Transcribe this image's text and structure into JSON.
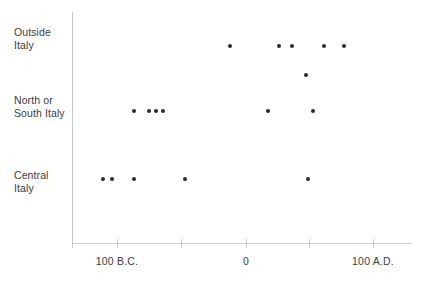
{
  "chart_data": {
    "type": "scatter",
    "title": "",
    "subtitle": "",
    "xlabel": "",
    "ylabel": "",
    "grid": false,
    "legend": null,
    "legend_position": "none",
    "x_axis": {
      "label": "",
      "range_years": [
        -135,
        115
      ],
      "tick_positions_years": [
        -135,
        -100,
        -50,
        0,
        50,
        100
      ],
      "tick_labels": [
        "",
        "100 B.C.",
        "",
        "0",
        "",
        "100 A.D."
      ],
      "labeled_ticks": [
        {
          "value": -100,
          "label": "100 B.C."
        },
        {
          "value": 0,
          "label": "0"
        },
        {
          "value": 100,
          "label": "100 A.D."
        }
      ]
    },
    "y_axis": {
      "label": "",
      "type": "categorical",
      "categories": [
        "Outside\nItaly",
        "North or\nSouth Italy",
        "Central\nItaly"
      ],
      "category_plain": [
        "Outside Italy",
        "North or South Italy",
        "Central Italy"
      ]
    },
    "series": [
      {
        "name": "Outside Italy",
        "category": "Outside Italy",
        "values": [
          -12,
          26,
          36,
          61,
          77
        ]
      },
      {
        "name": "Outside Italy (lower sub-row)",
        "category": "Outside Italy",
        "values": [
          47
        ]
      },
      {
        "name": "North or South Italy",
        "category": "North or South Italy",
        "values": [
          -87,
          -76,
          -70,
          -65,
          17,
          52
        ]
      },
      {
        "name": "Central Italy",
        "category": "Central Italy",
        "values": [
          -111,
          -105,
          -87,
          -47,
          48
        ]
      }
    ],
    "point_count": 17,
    "marker": {
      "shape": "circle",
      "color": "#2b2b33",
      "size_px": 4
    },
    "colors": {
      "background": "#ffffff",
      "axis": "#c9c9cd",
      "text": "#3c3c42",
      "marker": "#2b2b33"
    }
  },
  "axis_geometry": {
    "y_axis_x_px": 72,
    "y_axis_top_px": 12,
    "y_axis_bottom_px": 248,
    "x_axis_y_px": 243,
    "x_axis_left_px": 72,
    "x_axis_right_px": 412,
    "tick_x_px": [
      72,
      117,
      181,
      246,
      309,
      373
    ],
    "tick_label_y_px": 255,
    "row_y_px": {
      "outside_italy": 46,
      "outside_italy_sub": 75,
      "north_or_south_italy": 111,
      "central_italy": 179
    },
    "category_label_x_px": 14,
    "category_label_y_px": {
      "outside_italy": 26,
      "north_or_south_italy": 94,
      "central_italy": 169
    }
  },
  "points": [
    {
      "name": "outside-italy-1",
      "cx": 230,
      "cy": 46,
      "year": -12,
      "category": "Outside Italy"
    },
    {
      "name": "outside-italy-2",
      "cx": 279,
      "cy": 46,
      "year": 26,
      "category": "Outside Italy"
    },
    {
      "name": "outside-italy-3",
      "cx": 292,
      "cy": 46,
      "year": 36,
      "category": "Outside Italy"
    },
    {
      "name": "outside-italy-4",
      "cx": 324,
      "cy": 46,
      "year": 61,
      "category": "Outside Italy"
    },
    {
      "name": "outside-italy-5",
      "cx": 344,
      "cy": 46,
      "year": 77,
      "category": "Outside Italy"
    },
    {
      "name": "outside-italy-6",
      "cx": 306,
      "cy": 75,
      "year": 47,
      "category": "Outside Italy"
    },
    {
      "name": "north-south-italy-1",
      "cx": 134,
      "cy": 111,
      "year": -87,
      "category": "North or South Italy"
    },
    {
      "name": "north-south-italy-2",
      "cx": 149,
      "cy": 111,
      "year": -76,
      "category": "North or South Italy"
    },
    {
      "name": "north-south-italy-3",
      "cx": 156,
      "cy": 111,
      "year": -70,
      "category": "North or South Italy"
    },
    {
      "name": "north-south-italy-4",
      "cx": 163,
      "cy": 111,
      "year": -65,
      "category": "North or South Italy"
    },
    {
      "name": "north-south-italy-5",
      "cx": 268,
      "cy": 111,
      "year": 17,
      "category": "North or South Italy"
    },
    {
      "name": "north-south-italy-6",
      "cx": 313,
      "cy": 111,
      "year": 52,
      "category": "North or South Italy"
    },
    {
      "name": "central-italy-1",
      "cx": 103,
      "cy": 179,
      "year": -111,
      "category": "Central Italy"
    },
    {
      "name": "central-italy-2",
      "cx": 112,
      "cy": 179,
      "year": -105,
      "category": "Central Italy"
    },
    {
      "name": "central-italy-3",
      "cx": 134,
      "cy": 179,
      "year": -87,
      "category": "Central Italy"
    },
    {
      "name": "central-italy-4",
      "cx": 185,
      "cy": 179,
      "year": -47,
      "category": "Central Italy"
    },
    {
      "name": "central-italy-5",
      "cx": 308,
      "cy": 179,
      "year": 48,
      "category": "Central Italy"
    }
  ],
  "ticks": [
    {
      "name": "tick-0",
      "x": 72,
      "label": ""
    },
    {
      "name": "tick-1",
      "x": 117,
      "label": "100 B.C."
    },
    {
      "name": "tick-2",
      "x": 181,
      "label": ""
    },
    {
      "name": "tick-3",
      "x": 246,
      "label": "0"
    },
    {
      "name": "tick-4",
      "x": 309,
      "label": ""
    },
    {
      "name": "tick-5",
      "x": 373,
      "label": "100 A.D."
    }
  ],
  "categories": [
    {
      "name": "outside-italy",
      "label": "Outside\nItaly",
      "y": 26
    },
    {
      "name": "north-or-south-italy",
      "label": "North or\nSouth Italy",
      "y": 94
    },
    {
      "name": "central-italy",
      "label": "Central\nItaly",
      "y": 169
    }
  ]
}
